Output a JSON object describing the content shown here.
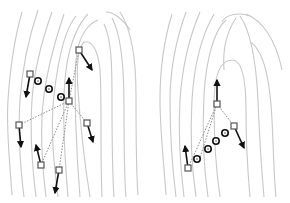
{
  "figure": {
    "colors": {
      "background": "#ffffff",
      "ridges": "#c8c8c8",
      "links": "#8a8a8a",
      "minutia_box": "#555555",
      "direction_arrow": "#111111",
      "ridge_count_circle": "#111111"
    },
    "panels": [
      {
        "name": "left-panel",
        "central_minutia": {
          "x": 69,
          "y": 101,
          "dir": [
            69,
            78
          ]
        },
        "neighbor_minutiae": [
          {
            "x": 79,
            "y": 50,
            "dir": [
              92,
              70
            ]
          },
          {
            "x": 30,
            "y": 74,
            "dir": [
              25,
              97
            ]
          },
          {
            "x": 19,
            "y": 125,
            "dir": [
              21,
              147
            ]
          },
          {
            "x": 87,
            "y": 123,
            "dir": [
              92,
              142
            ]
          },
          {
            "x": 41,
            "y": 165,
            "dir": [
              36,
              145
            ]
          },
          {
            "x": 59,
            "y": 170,
            "dir": [
              55,
              193
            ]
          }
        ],
        "ridge_count_circles": [
          {
            "x": 38,
            "y": 81
          },
          {
            "x": 49,
            "y": 89
          },
          {
            "x": 61,
            "y": 97
          }
        ]
      },
      {
        "name": "right-panel",
        "central_minutia": {
          "x": 217,
          "y": 104,
          "dir": [
            217,
            80
          ]
        },
        "neighbor_minutiae": [
          {
            "x": 234,
            "y": 126,
            "dir": [
              244,
              148
            ]
          },
          {
            "x": 188,
            "y": 168,
            "dir": [
              185,
              146
            ]
          }
        ],
        "ridge_count_circles": [
          {
            "x": 197,
            "y": 159
          },
          {
            "x": 208,
            "y": 149
          },
          {
            "x": 216,
            "y": 141
          },
          {
            "x": 225,
            "y": 133
          }
        ],
        "extra_links": [
          [
            [
              234,
              126
            ],
            [
              188,
              168
            ]
          ]
        ]
      }
    ]
  }
}
